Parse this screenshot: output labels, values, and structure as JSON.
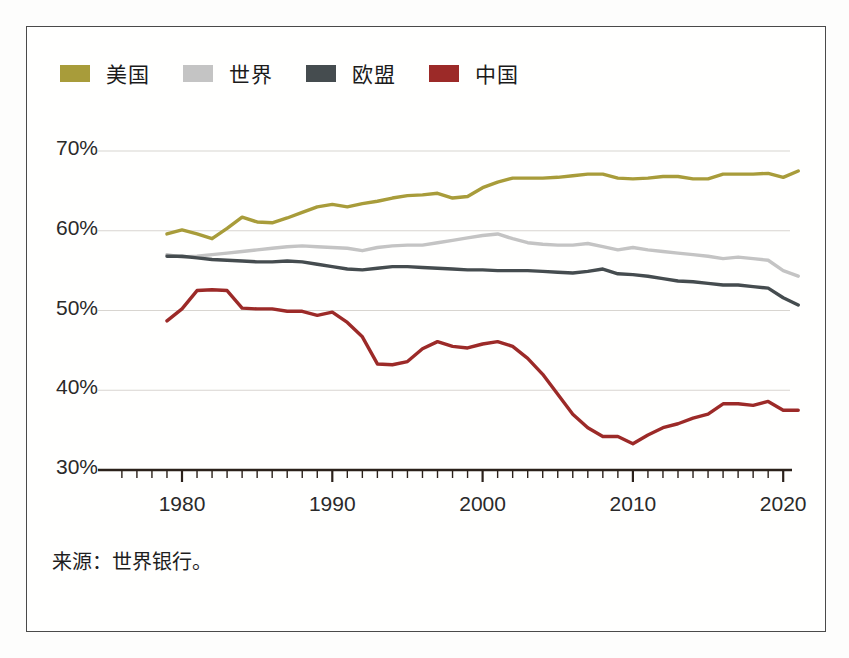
{
  "chart_data": {
    "type": "line",
    "title": "",
    "xlabel": "",
    "ylabel": "",
    "xlim": [
      1975,
      1922
    ],
    "ylim": [
      30,
      70
    ],
    "grid": true,
    "legend_position": "top-left",
    "ytick_labels": [
      "70%",
      "60%",
      "50%",
      "40%",
      "30%"
    ],
    "ytick_values": [
      70,
      60,
      50,
      40,
      30
    ],
    "xtick_labels": [
      "1980",
      "1990",
      "2000",
      "2010",
      "2020"
    ],
    "xtick_values": [
      1980,
      1990,
      2000,
      2010,
      2020
    ],
    "x": [
      1979,
      1980,
      1981,
      1982,
      1983,
      1984,
      1985,
      1986,
      1987,
      1988,
      1989,
      1990,
      1991,
      1992,
      1993,
      1994,
      1995,
      1996,
      1997,
      1998,
      1999,
      2000,
      2001,
      2002,
      2003,
      2004,
      2005,
      2006,
      2007,
      2008,
      2009,
      2010,
      2011,
      2012,
      2013,
      2014,
      2015,
      2016,
      2017,
      2018,
      2019,
      2020,
      2021
    ],
    "series": [
      {
        "name": "美国",
        "color": "#a89c3a",
        "values": [
          59.6,
          60.1,
          59.6,
          59.0,
          60.3,
          61.7,
          61.1,
          61.0,
          61.6,
          62.3,
          63.0,
          63.3,
          63.0,
          63.4,
          63.7,
          64.1,
          64.4,
          64.5,
          64.7,
          64.1,
          64.3,
          65.4,
          66.1,
          66.6,
          66.6,
          66.6,
          66.7,
          66.9,
          67.1,
          67.1,
          66.6,
          66.5,
          66.6,
          66.8,
          66.8,
          66.5,
          66.5,
          67.1,
          67.1,
          67.1,
          67.2,
          66.7,
          67.5
        ]
      },
      {
        "name": "世界",
        "color": "#c4c4c4",
        "values": [
          57.0,
          56.7,
          56.8,
          57.0,
          57.2,
          57.4,
          57.6,
          57.8,
          58.0,
          58.1,
          58.0,
          57.9,
          57.8,
          57.5,
          57.9,
          58.1,
          58.2,
          58.2,
          58.5,
          58.8,
          59.1,
          59.4,
          59.6,
          59.0,
          58.5,
          58.3,
          58.2,
          58.2,
          58.4,
          58.0,
          57.6,
          57.9,
          57.6,
          57.4,
          57.2,
          57.0,
          56.8,
          56.5,
          56.7,
          56.5,
          56.3,
          55.0,
          54.3
        ]
      },
      {
        "name": "欧盟",
        "color": "#454c4f",
        "values": [
          56.8,
          56.8,
          56.6,
          56.4,
          56.3,
          56.2,
          56.1,
          56.1,
          56.2,
          56.1,
          55.8,
          55.5,
          55.2,
          55.1,
          55.3,
          55.5,
          55.5,
          55.4,
          55.3,
          55.2,
          55.1,
          55.1,
          55.0,
          55.0,
          55.0,
          54.9,
          54.8,
          54.7,
          54.9,
          55.2,
          54.6,
          54.5,
          54.3,
          54.0,
          53.7,
          53.6,
          53.4,
          53.2,
          53.2,
          53.0,
          52.8,
          51.6,
          50.7
        ]
      },
      {
        "name": "中国",
        "color": "#9c2a28",
        "values": [
          48.7,
          50.2,
          52.5,
          52.6,
          52.5,
          50.3,
          50.2,
          50.2,
          49.9,
          49.9,
          49.4,
          49.8,
          48.5,
          46.7,
          43.3,
          43.2,
          43.6,
          45.2,
          46.1,
          45.5,
          45.3,
          45.8,
          46.1,
          45.5,
          44.0,
          42.0,
          39.5,
          37.0,
          35.3,
          34.2,
          34.2,
          33.3,
          34.4,
          35.3,
          35.8,
          36.5,
          37.0,
          38.3,
          38.3,
          38.1,
          38.6,
          37.5,
          37.5
        ]
      }
    ]
  },
  "legend": {
    "items": [
      {
        "label": "美国",
        "color": "#a89c3a"
      },
      {
        "label": "世界",
        "color": "#c4c4c4"
      },
      {
        "label": "欧盟",
        "color": "#454c4f"
      },
      {
        "label": "中国",
        "color": "#9c2a28"
      }
    ]
  },
  "source": {
    "text": "来源：世界银行。"
  },
  "axis": {
    "baseline_color": "#2b211a",
    "gridline_color": "#d8d5d0"
  }
}
